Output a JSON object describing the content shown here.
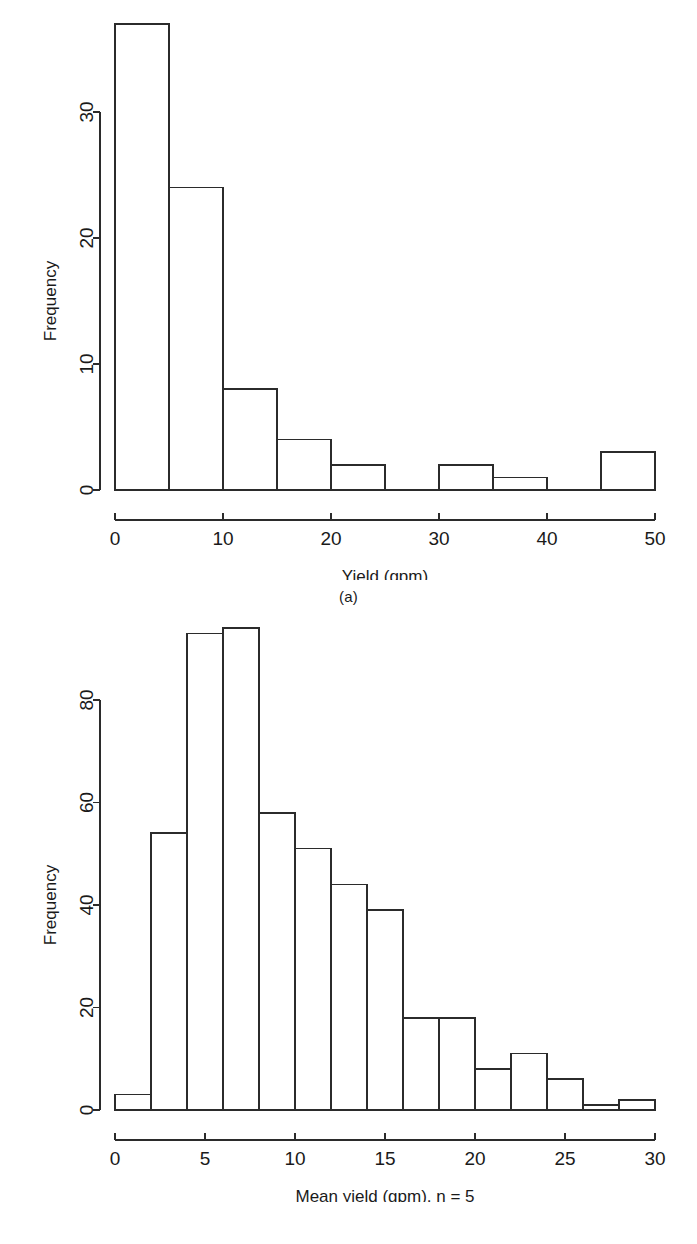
{
  "figure": {
    "background_color": "#ffffff",
    "line_color": "#2b2b2b",
    "bar_fill_color": "#ffffff"
  },
  "panels": [
    {
      "caption": "(a)",
      "ylabel": "Frequency",
      "xlabel": "Yield (gpm)",
      "xtick_labels": [
        "0",
        "10",
        "20",
        "30",
        "40",
        "50"
      ],
      "ytick_labels": [
        "0",
        "10",
        "20",
        "30"
      ]
    },
    {
      "caption": "(b)",
      "ylabel": "Frequency",
      "xlabel": "Mean yield (gpm), n = 5",
      "xtick_labels": [
        "0",
        "5",
        "10",
        "15",
        "20",
        "25",
        "30"
      ],
      "ytick_labels": [
        "0",
        "20",
        "40",
        "60",
        "80"
      ]
    }
  ],
  "chart_data": [
    {
      "type": "bar",
      "panel": "(a)",
      "title": "",
      "xlabel": "Yield (gpm)",
      "ylabel": "Frequency",
      "xlim": [
        0,
        50
      ],
      "ylim": [
        0,
        37
      ],
      "bin_width": 5,
      "grid": false,
      "legend": "none",
      "xticks": [
        0,
        10,
        20,
        30,
        40,
        50
      ],
      "yticks": [
        0,
        10,
        20,
        30
      ],
      "bin_edges": [
        0,
        5,
        10,
        15,
        20,
        25,
        30,
        35,
        40,
        45,
        50
      ],
      "categories": [
        "0-5",
        "5-10",
        "10-15",
        "15-20",
        "20-25",
        "25-30",
        "30-35",
        "35-40",
        "40-45",
        "45-50"
      ],
      "values": [
        37,
        24,
        8,
        4,
        2,
        0,
        2,
        1,
        0,
        3
      ]
    },
    {
      "type": "bar",
      "panel": "(b)",
      "title": "",
      "xlabel": "Mean yield (gpm), n = 5",
      "ylabel": "Frequency",
      "xlim": [
        0,
        30
      ],
      "ylim": [
        0,
        94
      ],
      "bin_width": 2,
      "grid": false,
      "legend": "none",
      "xticks": [
        0,
        5,
        10,
        15,
        20,
        25,
        30
      ],
      "yticks": [
        0,
        20,
        40,
        60,
        80
      ],
      "bin_edges": [
        0,
        2,
        4,
        6,
        8,
        10,
        12,
        14,
        16,
        18,
        20,
        22,
        24,
        26,
        28,
        30
      ],
      "categories": [
        "0-2",
        "2-4",
        "4-6",
        "6-8",
        "8-10",
        "10-12",
        "12-14",
        "14-16",
        "16-18",
        "18-20",
        "20-22",
        "22-24",
        "24-26",
        "26-28",
        "28-30"
      ],
      "values": [
        3,
        54,
        93,
        94,
        58,
        51,
        44,
        39,
        18,
        18,
        8,
        11,
        6,
        1,
        2
      ]
    }
  ]
}
